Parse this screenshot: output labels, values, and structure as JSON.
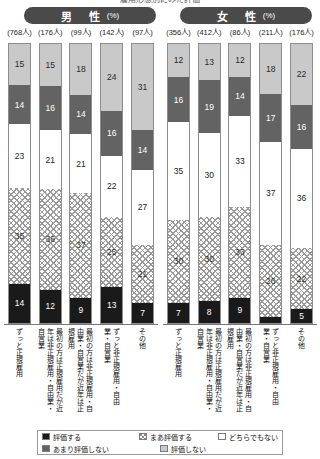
{
  "page": {
    "top_title_fragment": "雇用形態別にみた評価"
  },
  "panels": [
    {
      "key": "male",
      "gender_label": "男　性",
      "unit_label": "(%)",
      "n_labels": [
        "(768人)",
        "(176人)",
        "(99人)",
        "(142人)",
        "(97人)"
      ],
      "categories": [
        "ずっと正規雇用",
        "最初の方は正規雇用だが近年は非正規雇用・自由業・自営業",
        "最初の方は非正規雇用・自由業・自営業だが近年は正規雇用",
        "ずっと非正規雇用・自由業・自営業",
        "その他"
      ]
    },
    {
      "key": "female",
      "gender_label": "女　性",
      "unit_label": "(%)",
      "n_labels": [
        "(356人)",
        "(412人)",
        "(86人)",
        "(211人)",
        "(176人)"
      ],
      "categories": [
        "ずっと正規雇用",
        "最初の方は正規雇用だが近年は非正規雇用・自由業・自営業",
        "最初の方は非正規雇用・自由業・自営業だが近年は正規雇用",
        "ずっと非正規雇用・自由業・自営業",
        "その他"
      ]
    }
  ],
  "legend": {
    "items": [
      {
        "key": "hyouka",
        "label": "評価する"
      },
      {
        "key": "maa",
        "label": "まあ評価する"
      },
      {
        "key": "dochira",
        "label": "どちらでもない"
      },
      {
        "key": "amari",
        "label": "あまり評価しない"
      },
      {
        "key": "shinai",
        "label": "評価しない"
      }
    ]
  },
  "colors": {
    "hyouka": "#1a1a1a",
    "maa": "#ffffff",
    "dochira": "#ffffff",
    "amari": "#636363",
    "shinai": "#c9c9c9",
    "pill": "#4a4a4a",
    "border": "#8d8d8d"
  },
  "chart_data": {
    "type": "bar",
    "title": "雇用形態別にみた評価",
    "xlabel": "",
    "ylabel": "",
    "ylim": [
      0,
      100
    ],
    "stacked": true,
    "orientation": "vertical",
    "grid": false,
    "legend_position": "bottom",
    "series_order": [
      "評価する",
      "まあ評価する",
      "どちらでもない",
      "あまり評価しない",
      "評価しない"
    ],
    "panels": [
      {
        "name": "男性 (%)",
        "categories": [
          "ずっと正規雇用",
          "最初の方は正規雇用だが近年は非正規雇用・自由業・自営業",
          "最初の方は非正規雇用・自由業・自営業だが近年は正規雇用",
          "ずっと非正規雇用・自由業・自営業",
          "その他"
        ],
        "sample_sizes": [
          768,
          176,
          99,
          142,
          97
        ],
        "series": [
          {
            "name": "評価する",
            "values": [
              14,
              12,
              9,
              13,
              7
            ]
          },
          {
            "name": "まあ評価する",
            "values": [
              35,
              36,
              37,
              25,
              21
            ]
          },
          {
            "name": "どちらでもない",
            "values": [
              23,
              21,
              21,
              22,
              27
            ]
          },
          {
            "name": "あまり評価しない",
            "values": [
              14,
              16,
              14,
              16,
              14
            ]
          },
          {
            "name": "評価しない",
            "values": [
              15,
              15,
              18,
              24,
              31
            ]
          }
        ]
      },
      {
        "name": "女性 (%)",
        "categories": [
          "ずっと正規雇用",
          "最初の方は正規雇用だが近年は非正規雇用・自由業・自営業",
          "最初の方は非正規雇用・自由業・自営業だが近年は正規雇用",
          "ずっと非正規雇用・自由業・自営業",
          "その他"
        ],
        "sample_sizes": [
          356,
          412,
          86,
          211,
          176
        ],
        "series": [
          {
            "name": "評価する",
            "values": [
              7,
              8,
              9,
              2,
              5
            ]
          },
          {
            "name": "まあ評価する",
            "values": [
              30,
              30,
              33,
              26,
              22
            ]
          },
          {
            "name": "どちらでもない",
            "values": [
              35,
              30,
              33,
              37,
              36
            ]
          },
          {
            "name": "あまり評価しない",
            "values": [
              16,
              19,
              14,
              17,
              16
            ]
          },
          {
            "name": "評価しない",
            "values": [
              12,
              13,
              12,
              18,
              22
            ]
          }
        ]
      }
    ]
  }
}
